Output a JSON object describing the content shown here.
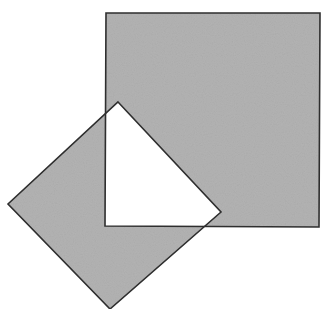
{
  "diagram": {
    "width": 327,
    "height": 309,
    "colors": {
      "background": "#ffffff",
      "fill": "#b3b3b3",
      "stroke": "#2e2e2e",
      "overlap": "#ffffff"
    },
    "shapes": [
      {
        "name": "axis-aligned-square",
        "points": [
          [
            106,
            13
          ],
          [
            320,
            13
          ],
          [
            319,
            227
          ],
          [
            105,
            226
          ]
        ]
      },
      {
        "name": "rotated-square",
        "points": [
          [
            118,
            102
          ],
          [
            221,
            212
          ],
          [
            110,
            309
          ],
          [
            8,
            204
          ]
        ]
      }
    ]
  }
}
